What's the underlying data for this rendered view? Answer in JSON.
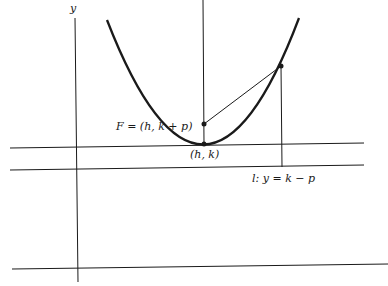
{
  "diagram": {
    "type": "parabola-focus-directrix",
    "axis_label_y": "y",
    "focus_label": "F = (h, k + p)",
    "vertex_label": "(h, k)",
    "directrix_label": "l: y = k − p",
    "colors": {
      "stroke": "#1a1a1a",
      "background": "#ffffff"
    }
  }
}
